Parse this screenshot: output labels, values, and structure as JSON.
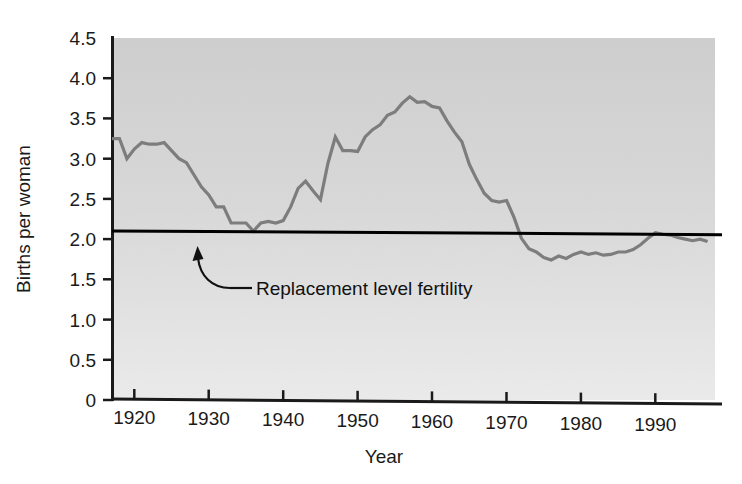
{
  "chart_data": {
    "type": "line",
    "title": "",
    "xlabel": "Year",
    "ylabel": "Births per woman",
    "xlim": [
      1917,
      1998
    ],
    "ylim": [
      0,
      4.5
    ],
    "grid": false,
    "legend_position": "none",
    "x_ticks": [
      "1920",
      "1930",
      "1940",
      "1950",
      "1960",
      "1970",
      "1980",
      "1990"
    ],
    "x_tick_values": [
      1920,
      1930,
      1940,
      1950,
      1960,
      1970,
      1980,
      1990
    ],
    "y_ticks": [
      "0",
      "0.5",
      "1.0",
      "1.5",
      "2.0",
      "2.5",
      "3.0",
      "3.5",
      "4.0",
      "4.5"
    ],
    "y_tick_values": [
      0,
      0.5,
      1.0,
      1.5,
      2.0,
      2.5,
      3.0,
      3.5,
      4.0,
      4.5
    ],
    "series": [
      {
        "name": "Total fertility rate",
        "color": "#7d7d7d",
        "x": [
          1917,
          1918,
          1919,
          1920,
          1921,
          1922,
          1923,
          1924,
          1925,
          1926,
          1927,
          1928,
          1929,
          1930,
          1931,
          1932,
          1933,
          1934,
          1935,
          1936,
          1937,
          1938,
          1939,
          1940,
          1941,
          1942,
          1943,
          1944,
          1945,
          1946,
          1947,
          1948,
          1949,
          1950,
          1951,
          1952,
          1953,
          1954,
          1955,
          1956,
          1957,
          1958,
          1959,
          1960,
          1961,
          1962,
          1963,
          1964,
          1965,
          1966,
          1967,
          1968,
          1969,
          1970,
          1971,
          1972,
          1973,
          1974,
          1975,
          1976,
          1977,
          1978,
          1979,
          1980,
          1981,
          1982,
          1983,
          1984,
          1985,
          1986,
          1987,
          1988,
          1989,
          1990,
          1991,
          1992,
          1993,
          1994,
          1995,
          1996,
          1997
        ],
        "values": [
          3.25,
          3.25,
          3.0,
          3.12,
          3.2,
          3.18,
          3.18,
          3.2,
          3.1,
          3.0,
          2.95,
          2.8,
          2.65,
          2.55,
          2.4,
          2.4,
          2.2,
          2.2,
          2.2,
          2.1,
          2.2,
          2.22,
          2.2,
          2.23,
          2.4,
          2.63,
          2.72,
          2.6,
          2.49,
          2.94,
          3.27,
          3.1,
          3.1,
          3.09,
          3.27,
          3.36,
          3.42,
          3.54,
          3.58,
          3.69,
          3.77,
          3.7,
          3.71,
          3.65,
          3.63,
          3.47,
          3.33,
          3.21,
          2.93,
          2.74,
          2.57,
          2.48,
          2.46,
          2.48,
          2.27,
          2.01,
          1.88,
          1.84,
          1.77,
          1.74,
          1.79,
          1.76,
          1.81,
          1.84,
          1.81,
          1.83,
          1.8,
          1.81,
          1.84,
          1.84,
          1.87,
          1.93,
          2.01,
          2.08,
          2.06,
          2.05,
          2.02,
          2.0,
          1.98,
          2.0,
          1.97
        ]
      }
    ],
    "reference_line": {
      "name": "Replacement level fertility",
      "value": 2.08,
      "color": "#000000",
      "label": "Replacement level fertility"
    },
    "annotations": [
      {
        "text": "Replacement level fertility",
        "points_to_year": 1931,
        "points_to_value": 2.08
      }
    ]
  },
  "axes": {
    "y_label": "Births per woman",
    "x_label": "Year"
  },
  "style": {
    "plot_bg_top": "#cfcfcf",
    "plot_bg_bottom": "#efefef",
    "axis_color": "#1a1a1a",
    "line_color": "#7d7d7d",
    "reference_color": "#000000"
  }
}
